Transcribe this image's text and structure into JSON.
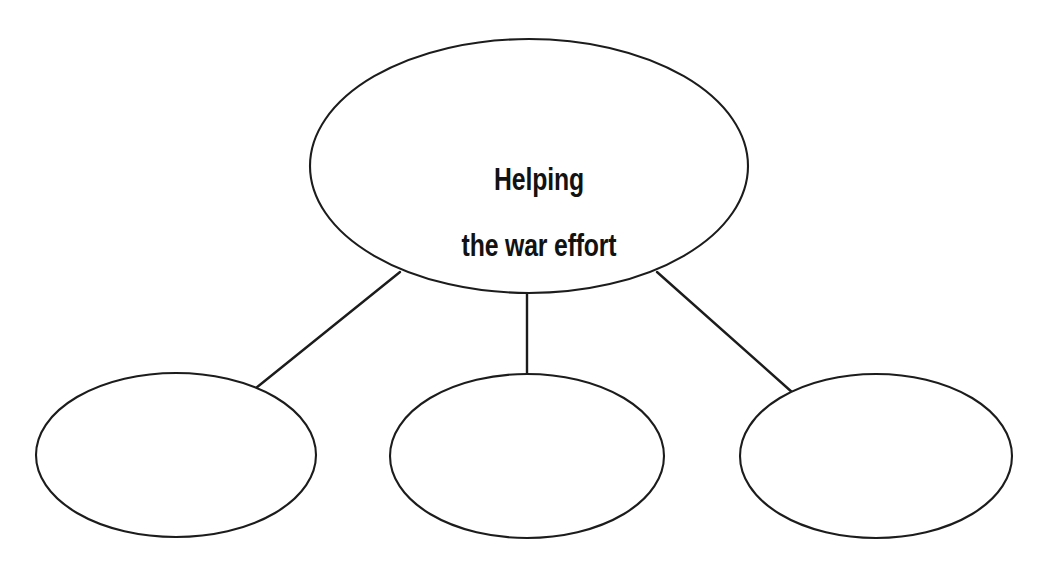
{
  "page": {
    "background_color": "#ffffff",
    "stroke_color": "#1c1c1c",
    "text_color": "#121212"
  },
  "diagram": {
    "type": "concept-web",
    "central_node": {
      "label": "Helping\nthe war effort",
      "lines": [
        "Helping",
        "the war effort"
      ],
      "shape": "ellipse",
      "cx": 529,
      "cy": 166,
      "rx": 219,
      "ry": 127
    },
    "branch_nodes": [
      {
        "label": "",
        "shape": "ellipse",
        "cx": 176,
        "cy": 455,
        "rx": 140,
        "ry": 82
      },
      {
        "label": "",
        "shape": "ellipse",
        "cx": 527,
        "cy": 456,
        "rx": 137,
        "ry": 82
      },
      {
        "label": "",
        "shape": "ellipse",
        "cx": 876,
        "cy": 456,
        "rx": 136,
        "ry": 82
      }
    ],
    "connectors": [
      {
        "name": "left-connector",
        "x1": 400,
        "y1": 272,
        "x2": 256,
        "y2": 388
      },
      {
        "name": "center-connector",
        "x1": 527,
        "y1": 292,
        "x2": 527,
        "y2": 378
      },
      {
        "name": "right-connector",
        "x1": 657,
        "y1": 272,
        "x2": 793,
        "y2": 393
      }
    ]
  }
}
